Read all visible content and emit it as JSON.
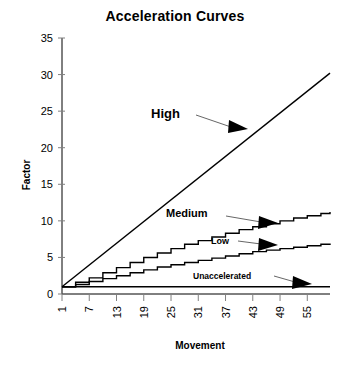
{
  "chart_data": {
    "type": "line",
    "title": "Acceleration Curves",
    "xlabel": "Movement",
    "ylabel": "Factor",
    "xlim": [
      1,
      60
    ],
    "ylim": [
      0,
      35
    ],
    "xticks": [
      1,
      7,
      13,
      19,
      25,
      31,
      37,
      43,
      49,
      55
    ],
    "yticks": [
      0,
      5,
      10,
      15,
      20,
      25,
      30,
      35
    ],
    "grid": false,
    "legend": "inline-annotations",
    "series": [
      {
        "name": "High",
        "label_text": "High",
        "x": [
          1,
          60
        ],
        "values": [
          1,
          30.2
        ]
      },
      {
        "name": "Medium",
        "label_text": "Medium",
        "x": [
          1,
          4,
          7,
          10,
          13,
          16,
          19,
          22,
          25,
          28,
          31,
          34,
          37,
          40,
          43,
          46,
          49,
          52,
          55,
          58,
          60
        ],
        "values": [
          1,
          1.6,
          2.2,
          2.9,
          3.6,
          4.3,
          5.0,
          5.6,
          6.2,
          6.8,
          7.3,
          7.8,
          8.3,
          8.8,
          9.2,
          9.6,
          10.0,
          10.4,
          10.7,
          11.0,
          11.2
        ]
      },
      {
        "name": "Low",
        "label_text": "Low",
        "x": [
          1,
          4,
          7,
          10,
          13,
          16,
          19,
          22,
          25,
          28,
          31,
          34,
          37,
          40,
          43,
          46,
          49,
          52,
          55,
          58,
          60
        ],
        "values": [
          1,
          1.3,
          1.7,
          2.1,
          2.5,
          2.9,
          3.3,
          3.7,
          4.0,
          4.3,
          4.6,
          4.9,
          5.2,
          5.5,
          5.8,
          6.0,
          6.2,
          6.4,
          6.6,
          6.8,
          6.9
        ]
      },
      {
        "name": "Unaccelerated",
        "label_text": "Unaccelerated",
        "x": [
          1,
          60
        ],
        "values": [
          1,
          1
        ]
      }
    ],
    "annotations": [
      {
        "text": "High",
        "note": "arrow points down-right to High line"
      },
      {
        "text": "Medium",
        "note": "arrow points right to Medium curve"
      },
      {
        "text": "Low",
        "note": "arrow points right to Low curve"
      },
      {
        "text": "Unaccelerated",
        "note": "arrow points down-right to flat line"
      }
    ],
    "colors": {
      "line": "#000000",
      "axis": "#000000",
      "tick": "#808080",
      "background": "#ffffff"
    }
  }
}
